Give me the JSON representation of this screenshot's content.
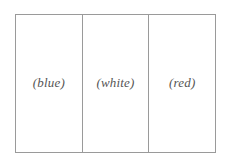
{
  "diagram": {
    "type": "tricolor-flag-outline",
    "stripes": [
      {
        "label": "(blue)",
        "color_name": "blue"
      },
      {
        "label": "(white)",
        "color_name": "white"
      },
      {
        "label": "(red)",
        "color_name": "red"
      }
    ]
  }
}
